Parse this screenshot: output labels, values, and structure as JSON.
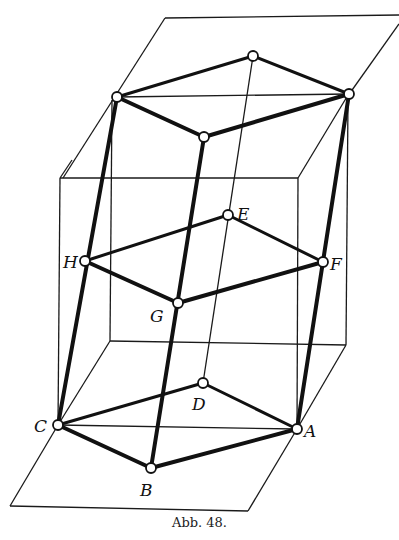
{
  "figure": {
    "caption": "Abb. 48.",
    "labels": {
      "A": "A",
      "B": "B",
      "C": "C",
      "D": "D",
      "E": "E",
      "F": "F",
      "G": "G",
      "H": "H"
    },
    "nodes": {
      "top_left": [
        117,
        97
      ],
      "top_back": [
        253,
        56
      ],
      "top_right": [
        349,
        94
      ],
      "top_front": [
        204,
        137
      ],
      "H": [
        85,
        261
      ],
      "E": [
        228,
        215
      ],
      "F": [
        323,
        262
      ],
      "G": [
        178,
        303
      ],
      "C": [
        58,
        425
      ],
      "D": [
        203,
        383
      ],
      "A": [
        297,
        429
      ],
      "B": [
        151,
        468
      ]
    }
  }
}
